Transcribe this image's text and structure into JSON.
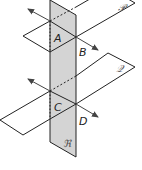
{
  "diagram": {
    "planes": [
      {
        "id": "P",
        "label": "𝒫",
        "role": "upper-horizontal-plane"
      },
      {
        "id": "Q",
        "label": "𝒬",
        "role": "lower-horizontal-plane"
      },
      {
        "id": "R",
        "label": "ℜ",
        "role": "vertical-transversal-plane"
      }
    ],
    "points": [
      {
        "id": "A",
        "label": "A"
      },
      {
        "id": "B",
        "label": "B"
      },
      {
        "id": "C",
        "label": "C"
      },
      {
        "id": "D",
        "label": "D"
      }
    ],
    "lines": [
      {
        "id": "AB",
        "through": [
          "A",
          "B"
        ],
        "arrows": "both"
      },
      {
        "id": "CD",
        "through": [
          "C",
          "D"
        ],
        "arrows": "both"
      }
    ],
    "colors": {
      "stroke": "#222222",
      "plane_R_fill": "#d4d4d4",
      "arrow": "#444444",
      "script_label": "#555555"
    }
  }
}
